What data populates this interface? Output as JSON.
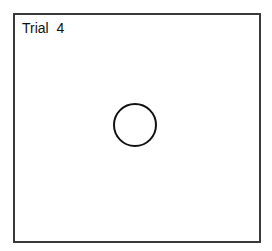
{
  "trial": {
    "label": "Trial  4",
    "number": 4
  },
  "stimulus": {
    "shape": "circle-outline",
    "color": "#111111"
  },
  "frame": {
    "border_color": "#3a3a3a",
    "background": "#ffffff"
  }
}
